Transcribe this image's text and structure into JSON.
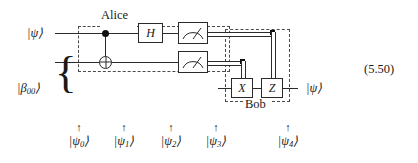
{
  "figure": {
    "equation_number": "(5.50)",
    "regions": [
      {
        "name": "alice",
        "label": "Alice"
      },
      {
        "name": "bob",
        "label": "Bob"
      }
    ],
    "inputs": {
      "top_wire_label": "|ψ⟩",
      "bell_pair_label_base": "|β",
      "bell_pair_label_sub": "00",
      "bell_pair_label_tail": "⟩",
      "brace": "{"
    },
    "output": {
      "label": "|ψ⟩"
    },
    "gates": [
      {
        "name": "cnot",
        "type": "cnot",
        "label": ""
      },
      {
        "name": "hadamard",
        "type": "box",
        "label": "H"
      },
      {
        "name": "measure-top",
        "type": "meter",
        "label": ""
      },
      {
        "name": "measure-bottom",
        "type": "meter",
        "label": ""
      },
      {
        "name": "pauli-x",
        "type": "box",
        "label": "X"
      },
      {
        "name": "pauli-z",
        "type": "box",
        "label": "Z"
      }
    ],
    "state_markers": [
      {
        "arrow": "↑",
        "base": "|ψ",
        "sub": "0",
        "tail": "⟩"
      },
      {
        "arrow": "↑",
        "base": "|ψ",
        "sub": "1",
        "tail": "⟩"
      },
      {
        "arrow": "↑",
        "base": "|ψ",
        "sub": "2",
        "tail": "⟩"
      },
      {
        "arrow": "↑",
        "base": "|ψ",
        "sub": "3",
        "tail": "⟩"
      },
      {
        "arrow": "↑",
        "base": "|ψ",
        "sub": "4",
        "tail": "⟩"
      }
    ],
    "colors": {
      "ink": "#1a1a1a",
      "wire": "#2b2b2b",
      "dashed": "#4a4a4a",
      "background": "#ffffff"
    }
  }
}
